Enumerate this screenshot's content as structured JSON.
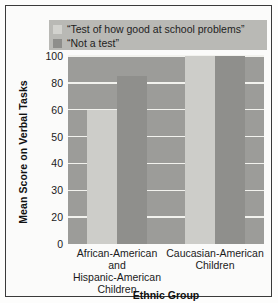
{
  "chart_data": {
    "type": "bar",
    "title": "",
    "xlabel": "Ethnic Group",
    "ylabel": "Mean Score on Verbal Tasks",
    "categories": [
      "African-American and Hispanic-American Children",
      "Caucasian-American Children"
    ],
    "series": [
      {
        "name": "“Test of how good at school problems”",
        "color": "#cdcdc9",
        "values": [
          60,
          100
        ]
      },
      {
        "name": "“Not a test”",
        "color": "#8f8f8c",
        "values": [
          85,
          100
        ]
      }
    ],
    "ylim": [
      0,
      105
    ],
    "yticks": [
      0,
      20,
      30,
      40,
      50,
      60,
      80,
      100
    ],
    "ytick_labels": [
      "0",
      "20",
      "30",
      "40",
      "50",
      "60",
      "80",
      "100"
    ],
    "grid": true,
    "legend_position": "top",
    "plot_background": "#9c9c99",
    "gridline_color": "#f2f2ee",
    "legend_background": "#b9b9b5"
  },
  "legend": {
    "items": [
      {
        "label": "“Test of how good at school problems”",
        "swatch": "light"
      },
      {
        "label": "“Not a test”",
        "swatch": "dark"
      }
    ]
  },
  "axes": {
    "y_title": "Mean Score on Verbal Tasks",
    "x_title": "Ethnic Group",
    "y_tick_labels": [
      "100",
      "80",
      "60",
      "50",
      "40",
      "30",
      "20",
      "0"
    ],
    "x_category_lines": [
      [
        "African-American and",
        "Hispanic-American",
        "Children"
      ],
      [
        "Caucasian-American",
        "Children"
      ]
    ]
  }
}
